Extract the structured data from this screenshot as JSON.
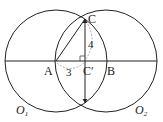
{
  "diagram": {
    "type": "geometry",
    "points": {
      "A": "A",
      "B": "B",
      "C": "C",
      "C_prime": "C′"
    },
    "circles": {
      "O1": "O",
      "O1_sub": "1",
      "O2": "O",
      "O2_sub": "2"
    },
    "segment_labels": {
      "AC_prime": "3",
      "CC_prime": "4"
    },
    "colors": {
      "stroke": "#222222",
      "dashed": "#999999",
      "background": "#ffffff"
    }
  }
}
